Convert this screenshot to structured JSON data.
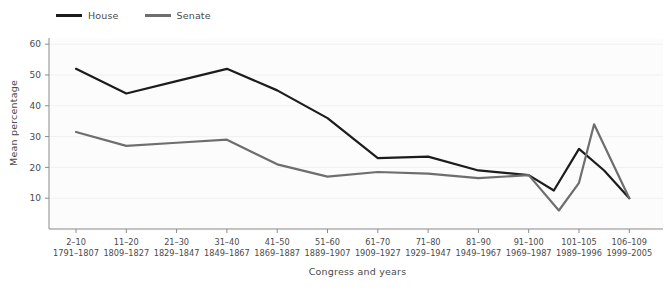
{
  "chart_data": {
    "type": "line",
    "title": "",
    "xlabel": "Congress and years",
    "ylabel": "Mean percentage",
    "ylim": [
      0,
      62
    ],
    "yticks": [
      10,
      20,
      30,
      40,
      50,
      60
    ],
    "grid": "horizontal",
    "legend_position": "top-left",
    "categories": [
      "2–10",
      "11–20",
      "21–30",
      "31–40",
      "41–50",
      "51–60",
      "61–70",
      "71–80",
      "81–90",
      "91–100",
      "101–105",
      "106–109"
    ],
    "categories_years": [
      "1791–1807",
      "1809–1827",
      "1829–1847",
      "1849–1867",
      "1869–1887",
      "1889–1907",
      "1909–1927",
      "1929–1947",
      "1949–1967",
      "1969–1987",
      "1989–1996",
      "1999–2005"
    ],
    "series": [
      {
        "name": "House",
        "color": "#1c1c1c",
        "values": [
          52,
          44,
          48,
          52,
          45,
          36,
          23,
          23.5,
          19,
          17.5,
          26,
          10
        ],
        "extra_points": [
          {
            "x_index": 9.5,
            "value": 12.5
          },
          {
            "x_index": 10.5,
            "value": 19
          }
        ]
      },
      {
        "name": "Senate",
        "color": "#6e6e6e",
        "values": [
          31.5,
          27,
          28,
          29,
          21,
          17,
          18.5,
          18,
          16.5,
          17.5,
          15,
          10
        ],
        "extra_points": [
          {
            "x_index": 9.6,
            "value": 6
          },
          {
            "x_index": 10.3,
            "value": 34
          }
        ]
      }
    ]
  },
  "legend": {
    "entries": [
      {
        "label": "House",
        "color": "#1c1c1c"
      },
      {
        "label": "Senate",
        "color": "#6e6e6e"
      }
    ]
  },
  "axes": {
    "y_title": "Mean percentage",
    "x_title": "Congress and years"
  }
}
